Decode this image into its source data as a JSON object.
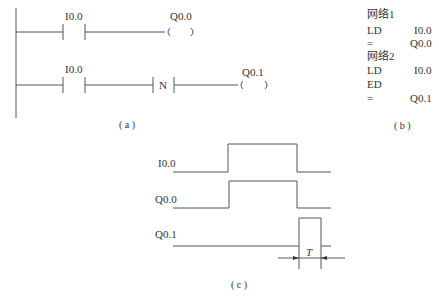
{
  "ladder": {
    "caption": "( a )",
    "rung1": {
      "contact": "I0.0",
      "coil": "Q0.0"
    },
    "rung2": {
      "contact": "I0.0",
      "edge": "N",
      "coil": "Q0.1"
    }
  },
  "stl": {
    "caption": "( b )",
    "lines": [
      {
        "op": "网络1",
        "arg": ""
      },
      {
        "op": "LD",
        "arg": "I0.0"
      },
      {
        "op": "=",
        "arg": "Q0.0"
      },
      {
        "op": "网络2",
        "arg": ""
      },
      {
        "op": "LD",
        "arg": "I0.0"
      },
      {
        "op": "ED",
        "arg": ""
      },
      {
        "op": "=",
        "arg": "Q0.1"
      }
    ]
  },
  "timing": {
    "caption": "( c )",
    "signals": [
      "I0.0",
      "Q0.0",
      "Q0.1"
    ],
    "pulse_label": "T"
  }
}
